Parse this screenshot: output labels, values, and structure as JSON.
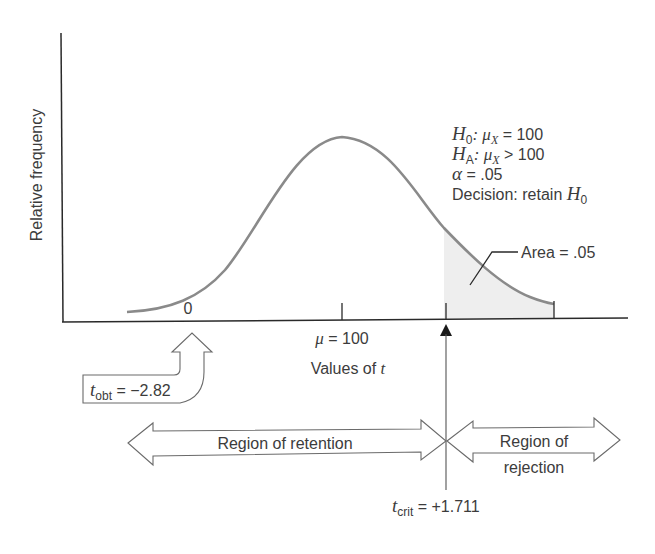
{
  "axis": {
    "y_label": "Relative frequency",
    "x_label_prefix": "Values of ",
    "x_label_var": "t",
    "tick_zero": "0",
    "tick_mu_symbol": "μ",
    "tick_mu_value": " = 100"
  },
  "hypotheses": {
    "h0_H": "H",
    "h0_sub": "0",
    "h0_mu": ": μ",
    "h0_mu_sub": "X",
    "h0_rest": " = 100",
    "ha_H": "H",
    "ha_sub": "A",
    "ha_mu": ": μ",
    "ha_mu_sub": "X",
    "ha_rest": " > 100",
    "alpha_symbol": "α",
    "alpha_rest": " = .05",
    "decision_text": "Decision: retain ",
    "decision_H": "H",
    "decision_sub": "0"
  },
  "area_label": "Area = .05",
  "t_obt": {
    "var": "t",
    "sub": "obt",
    "value": " = −2.82"
  },
  "t_crit": {
    "var": "t",
    "sub": "crit",
    "value": " = +1.711"
  },
  "regions": {
    "retention": "Region of retention",
    "rejection_line1": "Region of",
    "rejection_line2": "rejection"
  },
  "colors": {
    "curve": "#8a8a8a",
    "axis": "#2a2a2a",
    "shade": "#eeeeee",
    "text": "#3c3c3c"
  }
}
